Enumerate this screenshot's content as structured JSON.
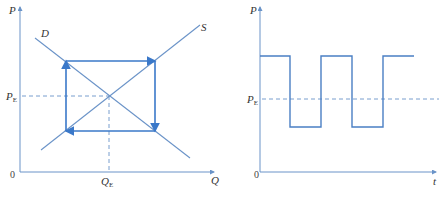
{
  "figures": [
    {
      "id": "left",
      "title": "Cobweb supply-demand diagram",
      "y_axis_label": "P",
      "x_axis_label": "Q",
      "origin_label": "0",
      "price_label": "P",
      "price_subscript": "E",
      "quantity_label": "Q",
      "quantity_subscript": "E",
      "demand_label": "D",
      "supply_label": "S"
    },
    {
      "id": "right",
      "title": "Price over time oscillation",
      "y_axis_label": "P",
      "x_axis_label": "t",
      "origin_label": "0",
      "price_label": "P",
      "price_subscript": "E"
    }
  ],
  "colors": {
    "curve": "#5b8ac6",
    "path": "#3a78c9",
    "axis": "#6a93c8",
    "dashed": "#6a93c8",
    "text": "#333333"
  }
}
